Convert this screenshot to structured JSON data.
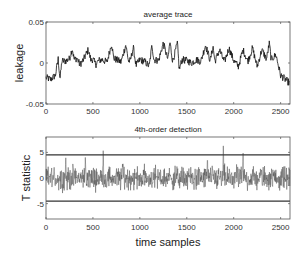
{
  "chart_data": [
    {
      "type": "line",
      "title": "average trace",
      "xlabel": "",
      "ylabel": "leakage",
      "xlim": [
        0,
        2600
      ],
      "ylim": [
        -0.05,
        0.05
      ],
      "xticks": [
        0,
        500,
        1000,
        1500,
        2000,
        2500
      ],
      "xtick_labels": [
        "0",
        "500",
        "1000",
        "1500",
        "2000",
        "2500"
      ],
      "yticks": [
        -0.05,
        0,
        0.05
      ],
      "ytick_labels": [
        "-0.05",
        "0",
        "0.05"
      ],
      "grid": false,
      "series": [
        {
          "name": "average trace",
          "color": "#111111",
          "x": [
            0,
            50,
            100,
            130,
            150,
            170,
            200,
            250,
            280,
            300,
            330,
            360,
            400,
            450,
            480,
            500,
            530,
            560,
            600,
            650,
            700,
            720,
            750,
            800,
            850,
            880,
            900,
            930,
            960,
            1000,
            1050,
            1100,
            1130,
            1150,
            1200,
            1250,
            1300,
            1320,
            1350,
            1400,
            1420,
            1450,
            1500,
            1550,
            1600,
            1650,
            1700,
            1750,
            1780,
            1800,
            1850,
            1900,
            1950,
            2000,
            2050,
            2100,
            2150,
            2200,
            2250,
            2300,
            2350,
            2380,
            2400,
            2450,
            2500,
            2550,
            2600
          ],
          "values": [
            -0.018,
            -0.02,
            -0.015,
            0.005,
            -0.02,
            0.003,
            0.002,
            0.005,
            0.018,
            0.004,
            0.006,
            -0.002,
            0.004,
            0.016,
            0.003,
            0.005,
            -0.002,
            0.003,
            0.004,
            0.001,
            0.024,
            0.006,
            0.004,
            0.001,
            0.022,
            0.002,
            0.003,
            0.019,
            -0.003,
            0.004,
            0.002,
            -0.004,
            0.022,
            0.004,
            0.003,
            0.024,
            0.004,
            0.026,
            0.002,
            0.024,
            -0.008,
            0.004,
            0.003,
            0.0,
            0.004,
            0.002,
            0.022,
            0.003,
            0.02,
            0.002,
            0.016,
            0.001,
            0.018,
            0.003,
            -0.004,
            0.016,
            0.002,
            0.018,
            -0.004,
            0.016,
            0.005,
            0.024,
            0.004,
            0.01,
            -0.015,
            -0.02,
            -0.025
          ]
        }
      ]
    },
    {
      "type": "line",
      "title": "4th-order detection",
      "xlabel": "time samples",
      "ylabel": "T statistic",
      "xlim": [
        0,
        2600
      ],
      "ylim": [
        -8,
        8
      ],
      "xticks": [
        0,
        500,
        1000,
        1500,
        2000,
        2500
      ],
      "xtick_labels": [
        "0",
        "500",
        "1000",
        "1500",
        "2000",
        "2500"
      ],
      "yticks": [
        -5,
        0,
        5
      ],
      "ytick_labels": [
        "-5",
        "0",
        "5"
      ],
      "grid": false,
      "thresholds": [
        4.5,
        -4.5
      ],
      "series": [
        {
          "name": "T statistic",
          "color": "#555555",
          "noise_amplitude": 2.0,
          "spikes": [
            {
              "x": 210,
              "value": 4.5
            },
            {
              "x": 420,
              "value": 4.8
            },
            {
              "x": 610,
              "value": 6.0
            },
            {
              "x": 820,
              "value": 3.0
            },
            {
              "x": 1720,
              "value": 4.5
            },
            {
              "x": 1890,
              "value": 7.0
            },
            {
              "x": 2100,
              "value": 5.0
            }
          ]
        }
      ]
    }
  ]
}
